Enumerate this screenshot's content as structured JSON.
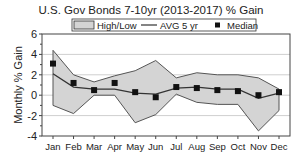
{
  "chart_data": {
    "type": "line",
    "title": "U.S. Gov Bonds 7-10yr (2013-2017) % Gain",
    "xlabel": "",
    "ylabel": "Monthly % Gain",
    "ylim": [
      -4,
      6
    ],
    "yticks": [
      -4,
      -2,
      0,
      2,
      4,
      6
    ],
    "grid": true,
    "legend": [
      "High/Low",
      "AVG 5 yr",
      "Median"
    ],
    "legend_position": "top",
    "categories": [
      "Jan",
      "Feb",
      "Mar",
      "Apr",
      "May",
      "Jun",
      "Jul",
      "Aug",
      "Sep",
      "Oct",
      "Nov",
      "Dec"
    ],
    "series": [
      {
        "name": "High",
        "values": [
          4.4,
          2.0,
          1.3,
          1.9,
          2.4,
          3.4,
          1.7,
          2.2,
          2.0,
          2.0,
          1.7,
          0.6
        ]
      },
      {
        "name": "Low",
        "values": [
          -1.0,
          -1.8,
          0.0,
          0.0,
          -2.7,
          -1.9,
          0.1,
          -0.7,
          -0.9,
          -0.9,
          -3.5,
          -1.5
        ]
      },
      {
        "name": "AVG 5 yr",
        "values": [
          2.1,
          0.8,
          0.6,
          0.6,
          0.2,
          0.1,
          0.7,
          0.8,
          0.6,
          0.6,
          -0.3,
          0.2
        ]
      },
      {
        "name": "Median",
        "values": [
          3.1,
          1.2,
          0.5,
          1.2,
          0.3,
          -0.2,
          0.8,
          0.7,
          0.5,
          0.4,
          0.0,
          0.3
        ]
      }
    ]
  }
}
